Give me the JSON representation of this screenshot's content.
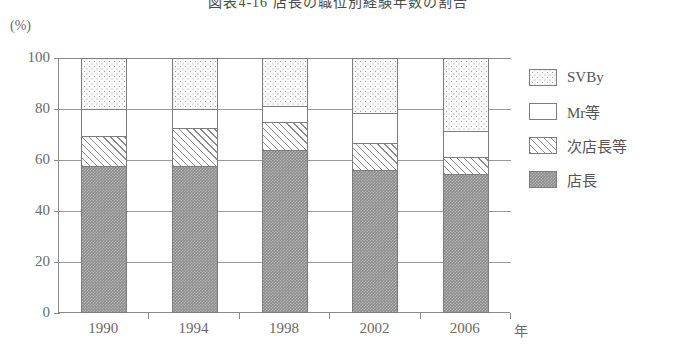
{
  "figure": {
    "title": "図表4-16 店長の職位別経験年数の割合",
    "y_unit": "(%)",
    "x_unit": "年"
  },
  "chart_data": {
    "type": "bar",
    "stacked": true,
    "stacked_percent": true,
    "title": "図表4-16 店長の職位別経験年数の割合",
    "xlabel": "年",
    "ylabel": "(%)",
    "ylim": [
      0,
      100
    ],
    "yticks": [
      0,
      20,
      40,
      60,
      80,
      100
    ],
    "ytick_labels": [
      "0",
      "20",
      "40",
      "60",
      "80",
      "100"
    ],
    "grid": true,
    "legend_position": "right",
    "categories": [
      "1990",
      "1994",
      "1998",
      "2002",
      "2006"
    ],
    "series": [
      {
        "name": "店長",
        "fill": "gray-stipple",
        "values": [
          57.5,
          57.5,
          64.0,
          56.0,
          54.5
        ]
      },
      {
        "name": "次店長等",
        "fill": "diagonal-hatch",
        "values": [
          12.0,
          15.0,
          11.0,
          10.5,
          6.5
        ]
      },
      {
        "name": "Mr等",
        "fill": "white",
        "values": [
          10.5,
          7.5,
          6.0,
          12.0,
          10.5
        ]
      },
      {
        "name": "SVBy",
        "fill": "dotted",
        "values": [
          20.0,
          20.0,
          19.0,
          21.5,
          28.5
        ]
      }
    ],
    "colors": {
      "axis": "#8a8a8a",
      "grid": "#9a9a9a",
      "text": "#6a6a6a",
      "segment_border": "#7d7d7d",
      "gray_fill": "#8d8d8d",
      "hatch_stroke": "#8b8b8b",
      "dot_stroke": "#9d9d9d",
      "white_fill": "#ffffff"
    }
  },
  "legend": {
    "items": [
      {
        "label": "SVBy",
        "fill": "dotted"
      },
      {
        "label": "Mr等",
        "fill": "white"
      },
      {
        "label": "次店長等",
        "fill": "diagonal-hatch"
      },
      {
        "label": "店長",
        "fill": "gray-stipple"
      }
    ]
  }
}
